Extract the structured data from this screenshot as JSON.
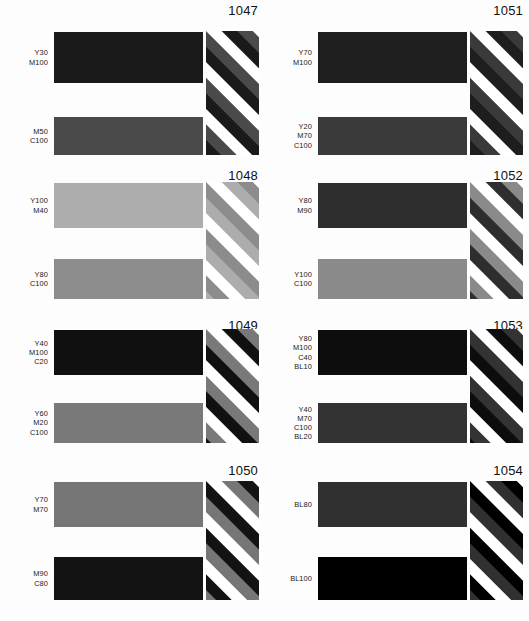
{
  "sheet": {
    "title": "Color reference chart",
    "background": "#fdfdfd",
    "columns": 2,
    "rows": 4
  },
  "geometry": {
    "cell_width_left": 264,
    "cell_width_right": 265,
    "row_heights": [
      165,
      150,
      145,
      161
    ],
    "bar_left": 54,
    "bar_width": 149,
    "stripe_left": 206,
    "stripe_width": 53,
    "stripe_angle_deg": 45,
    "label_column_width": 48
  },
  "cells": [
    {
      "ref": "1047",
      "top": {
        "label": "Y30\nM100",
        "lines": [
          "Y30",
          "M100"
        ],
        "color": "#1a1a1a"
      },
      "bottom": {
        "label": "M50\nC100",
        "lines": [
          "M50",
          "C100"
        ],
        "color": "#4a4a4a"
      },
      "bar_top_y": 32,
      "bar_top_h": 51,
      "bar_bottom_y": 117,
      "bar_bottom_h": 38,
      "stripe_y": 31,
      "stripe_h": 124
    },
    {
      "ref": "1051",
      "top": {
        "label": "Y70\nM100",
        "lines": [
          "Y70",
          "M100"
        ],
        "color": "#1e1e1e"
      },
      "bottom": {
        "label": "Y20\nM70\nC100",
        "lines": [
          "Y20",
          "M70",
          "C100"
        ],
        "color": "#3a3a3a"
      },
      "bar_top_y": 32,
      "bar_top_h": 51,
      "bar_bottom_y": 117,
      "bar_bottom_h": 38,
      "stripe_y": 31,
      "stripe_h": 124
    },
    {
      "ref": "1048",
      "top": {
        "label": "Y100\nM40",
        "lines": [
          "Y100",
          "M40"
        ],
        "color": "#adadad"
      },
      "bottom": {
        "label": "Y80\nC100",
        "lines": [
          "Y80",
          "C100"
        ],
        "color": "#8c8c8c"
      },
      "bar_top_y": 18,
      "bar_top_h": 45,
      "bar_bottom_y": 94,
      "bar_bottom_h": 40,
      "stripe_y": 17,
      "stripe_h": 117
    },
    {
      "ref": "1052",
      "top": {
        "label": "Y80\nM90",
        "lines": [
          "Y80",
          "M90"
        ],
        "color": "#2e2e2e"
      },
      "bottom": {
        "label": "Y100\nC100",
        "lines": [
          "Y100",
          "C100"
        ],
        "color": "#8a8a8a"
      },
      "bar_top_y": 18,
      "bar_top_h": 45,
      "bar_bottom_y": 94,
      "bar_bottom_h": 40,
      "stripe_y": 17,
      "stripe_h": 117
    },
    {
      "ref": "1049",
      "top": {
        "label": "Y40\nM100\nC20",
        "lines": [
          "Y40",
          "M100",
          "C20"
        ],
        "color": "#101010"
      },
      "bottom": {
        "label": "Y60\nM20\nC100",
        "lines": [
          "Y60",
          "M20",
          "C100"
        ],
        "color": "#797979"
      },
      "bar_top_y": 15,
      "bar_top_h": 45,
      "bar_bottom_y": 88,
      "bar_bottom_h": 40,
      "stripe_y": 14,
      "stripe_h": 114
    },
    {
      "ref": "1053",
      "top": {
        "label": "Y80\nM100\nC40\nBL10",
        "lines": [
          "Y80",
          "M100",
          "C40",
          "BL10"
        ],
        "color": "#0d0d0d"
      },
      "bottom": {
        "label": "Y40\nM70\nC100\nBL20",
        "lines": [
          "Y40",
          "M70",
          "C100",
          "BL20"
        ],
        "color": "#333333"
      },
      "bar_top_y": 15,
      "bar_top_h": 45,
      "bar_bottom_y": 88,
      "bar_bottom_h": 40,
      "stripe_y": 14,
      "stripe_h": 114
    },
    {
      "ref": "1050",
      "top": {
        "label": "Y70\nM70",
        "lines": [
          "Y70",
          "M70"
        ],
        "color": "#767676"
      },
      "bottom": {
        "label": "M90\nC80",
        "lines": [
          "M90",
          "C80"
        ],
        "color": "#131313"
      },
      "bar_top_y": 22,
      "bar_top_h": 45,
      "bar_bottom_y": 97,
      "bar_bottom_h": 43,
      "stripe_y": 21,
      "stripe_h": 119
    },
    {
      "ref": "1054",
      "top": {
        "label": "BL80",
        "lines": [
          "BL80"
        ],
        "color": "#303030"
      },
      "bottom": {
        "label": "BL100",
        "lines": [
          "BL100"
        ],
        "color": "#000000"
      },
      "bar_top_y": 22,
      "bar_top_h": 45,
      "bar_bottom_y": 97,
      "bar_bottom_h": 43,
      "stripe_y": 21,
      "stripe_h": 119
    }
  ]
}
